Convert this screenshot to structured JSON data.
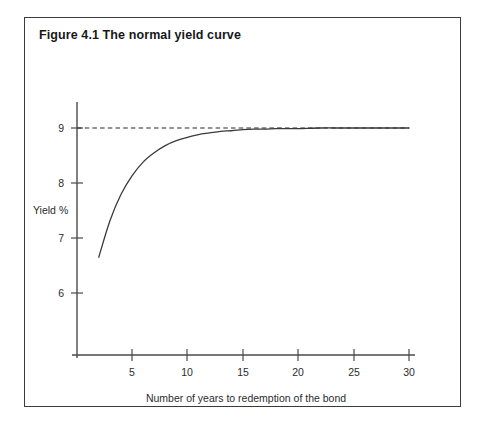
{
  "figure": {
    "title": "Figure 4.1 The normal yield curve",
    "border_color": "#3b3b3b",
    "background": "#ffffff"
  },
  "chart_data": {
    "type": "line",
    "title": "Figure 4.1 The normal yield curve",
    "xlabel": "Number of years to redemption of the bond",
    "ylabel": "Yield %",
    "xlim": [
      0,
      31
    ],
    "ylim": [
      5.4,
      9.6
    ],
    "grid": false,
    "legend": null,
    "xticks": [
      5,
      10,
      15,
      20,
      25,
      30
    ],
    "xtick_labels": [
      "5",
      "10",
      "15",
      "20",
      "25",
      "30"
    ],
    "yticks": [
      6,
      7,
      8,
      9
    ],
    "ytick_labels": [
      "6",
      "7",
      "8",
      "9"
    ],
    "line_color": "#3a3a3a",
    "asymptote": {
      "value": 9,
      "style": "dashed",
      "color": "#2b2b2b",
      "x_from": 2,
      "x_to": 30
    },
    "series": [
      {
        "name": "Normal yield curve",
        "x": [
          2,
          3,
          4,
          5,
          6,
          7,
          8,
          9,
          10,
          11,
          12,
          13,
          14,
          15,
          16,
          17,
          18,
          19,
          20,
          22,
          24,
          26,
          28,
          30
        ],
        "values": [
          6.65,
          7.31,
          7.79,
          8.13,
          8.38,
          8.55,
          8.68,
          8.77,
          8.83,
          8.88,
          8.91,
          8.94,
          8.95,
          8.97,
          8.98,
          8.98,
          8.99,
          8.99,
          8.99,
          9.0,
          9.0,
          9.0,
          9.0,
          9.0
        ]
      }
    ]
  },
  "labels": {
    "x_axis_title": "Number of years to redemption of the bond",
    "y_axis_title": "Yield %"
  }
}
